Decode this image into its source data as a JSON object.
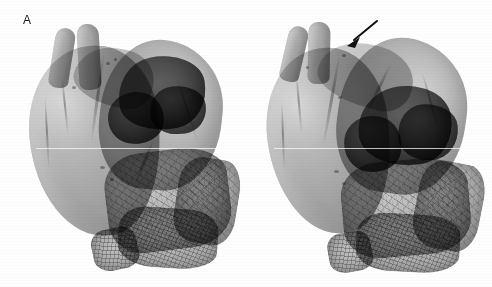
{
  "figure": {
    "type": "three-dimensional-volume-rendered-medical-image",
    "modality": "3D reconstruction",
    "background_color": "#fefefe",
    "panel_count": 2,
    "width_px": 492,
    "height_px": 287
  },
  "panels": [
    {
      "id": "a",
      "label": "A",
      "label_position": {
        "x": 23,
        "y": 14
      },
      "description": "Volume rendered heart, anterior oblique view; translucent myocardium with darker opacified chamber superiorly and coarse textured structure inferiorly",
      "has_annotation": false,
      "structures": [
        {
          "name": "great-vessel-left",
          "tone": "#a8a8a8"
        },
        {
          "name": "great-vessel-right",
          "tone": "#a8a8a8"
        },
        {
          "name": "myocardial-body",
          "tone": "#b2b2b2"
        },
        {
          "name": "right-lobe",
          "tone": "#a8a8a8"
        },
        {
          "name": "dark-chamber-mass",
          "tone": "#5c5c5c"
        },
        {
          "name": "dark-chamber-lobe",
          "tone": "#646464"
        },
        {
          "name": "textured-mesh-structure",
          "tone": "#969696"
        }
      ]
    },
    {
      "id": "b",
      "label": "B",
      "label_position": {
        "x": 269,
        "y": 14
      },
      "description": "Volume rendered heart, same subject rotated; arrow marks structure near the great-vessel root",
      "has_annotation": true,
      "annotation": {
        "name": "pointer-arrow",
        "shape": "solid-headed-straight-arrow",
        "color": "#111111",
        "tail": {
          "x": 377,
          "y": 67
        },
        "tip": {
          "x": 347,
          "y": 91
        },
        "direction": "down-left"
      },
      "structures": [
        {
          "name": "great-vessel-left",
          "tone": "#a8a8a8"
        },
        {
          "name": "great-vessel-right",
          "tone": "#a8a8a8"
        },
        {
          "name": "myocardial-body",
          "tone": "#b4b4b4"
        },
        {
          "name": "right-lobe",
          "tone": "#a6a6a6"
        },
        {
          "name": "dark-chamber-mass",
          "tone": "#585858"
        },
        {
          "name": "dark-chamber-lobe",
          "tone": "#606060"
        },
        {
          "name": "textured-mesh-structure",
          "tone": "#949494"
        }
      ]
    }
  ],
  "colors": {
    "background": "#fefefe",
    "label_text": "#1d1d1d",
    "tissue_light": "#cfcfcf",
    "tissue_mid": "#a0a0a0",
    "tissue_dark": "#575757",
    "mesh_edge": "#606060",
    "annotation": "#111111",
    "scanline": "#ffffff"
  },
  "artifacts": {
    "horizontal_scanline_y": 148,
    "scanline_note": "faint bright horizontal line crossing both panels"
  }
}
